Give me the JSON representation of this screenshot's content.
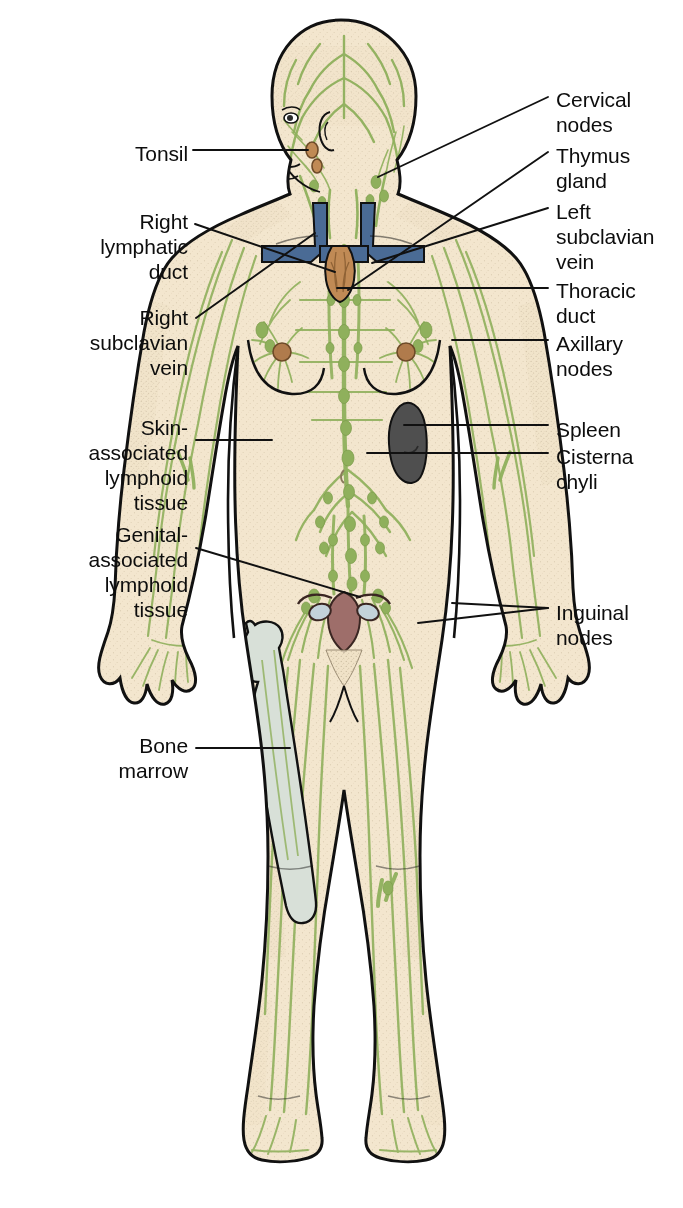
{
  "colors": {
    "skin": "#f3e6ce",
    "skin_shade": "#ece0c4",
    "lymph_green": "#8fb05c",
    "lymph_green_dark": "#7a9b49",
    "outline": "#111111",
    "vein_blue": "#4a6b95",
    "thymus_brown": "#c08a55",
    "spleen_gray": "#4f4f4f",
    "uterus_mauve": "#9e6e6a",
    "ovary_blue": "#c3d2da",
    "bone_gray": "#d6ded6",
    "background": "#ffffff",
    "leader_line": "#111111",
    "text": "#0d0d0d"
  },
  "labels_left": [
    {
      "id": "tonsil",
      "text": "Tonsil",
      "x": 78,
      "y": 141,
      "w": 110,
      "lines": 1
    },
    {
      "id": "right-lymphatic-duct",
      "text": "Right\nlymphatic\nduct",
      "x": 55,
      "y": 209,
      "w": 133,
      "lines": 3
    },
    {
      "id": "right-subclavian-vein",
      "text": "Right\nsubclavian\nvein",
      "x": 48,
      "y": 305,
      "w": 140,
      "lines": 3
    },
    {
      "id": "skin-associated-lymphoid-tissue",
      "text": "Skin-\nassociated\nlymphoid\ntissue",
      "x": 40,
      "y": 415,
      "w": 148,
      "lines": 4
    },
    {
      "id": "genital-associated-lymphoid-tissue",
      "text": "Genital-\nassociated\nlymphoid\ntissue",
      "x": 40,
      "y": 522,
      "w": 148,
      "lines": 4
    },
    {
      "id": "bone-marrow",
      "text": "Bone\nmarrow",
      "x": 80,
      "y": 733,
      "w": 108,
      "lines": 2
    }
  ],
  "labels_right": [
    {
      "id": "cervical-nodes",
      "text": "Cervical\nnodes",
      "x": 556,
      "y": 87,
      "lines": 2
    },
    {
      "id": "thymus-gland",
      "text": "Thymus\ngland",
      "x": 556,
      "y": 143,
      "lines": 2
    },
    {
      "id": "left-subclavian-vein",
      "text": "Left\nsubclavian\nvein",
      "x": 556,
      "y": 199,
      "lines": 3
    },
    {
      "id": "thoracic-duct",
      "text": "Thoracic\nduct",
      "x": 556,
      "y": 278,
      "lines": 2
    },
    {
      "id": "axillary-nodes",
      "text": "Axillary\nnodes",
      "x": 556,
      "y": 331,
      "lines": 2
    },
    {
      "id": "spleen",
      "text": "Spleen",
      "x": 556,
      "y": 417,
      "lines": 1
    },
    {
      "id": "cisterna-chyli",
      "text": "Cisterna\nchyli",
      "x": 556,
      "y": 444,
      "lines": 2
    },
    {
      "id": "inguinal-nodes",
      "text": "Inguinal\nnodes",
      "x": 556,
      "y": 600,
      "lines": 2
    }
  ],
  "leader_lines": [
    {
      "id": "tonsil-leader",
      "points": "193,150 308,150"
    },
    {
      "id": "right-lymphatic-duct-leader",
      "points": "195,224 335,272"
    },
    {
      "id": "right-subclavian-vein-leader",
      "points": "196,318 315,233"
    },
    {
      "id": "skin-associated-leader",
      "points": "196,440 272,440"
    },
    {
      "id": "genital-associated-leader",
      "points": "196,548 360,597"
    },
    {
      "id": "bone-marrow-leader",
      "points": "196,748 290,748"
    },
    {
      "id": "cervical-nodes-leader",
      "points": "548,97 378,177"
    },
    {
      "id": "thymus-gland-leader",
      "points": "548,152 348,290"
    },
    {
      "id": "left-subclavian-vein-leader",
      "points": "548,208 372,263"
    },
    {
      "id": "thoracic-duct-leader",
      "points": "548,288 337,288"
    },
    {
      "id": "axillary-nodes-leader",
      "points": "548,340 452,340"
    },
    {
      "id": "spleen-leader",
      "points": "548,425 404,425"
    },
    {
      "id": "cisterna-chyli-leader",
      "points": "548,453 367,453"
    },
    {
      "id": "inguinal-nodes-leader-a",
      "points": "548,608 452,603"
    },
    {
      "id": "inguinal-nodes-leader-b",
      "points": "548,608 418,623"
    }
  ],
  "organs": [
    {
      "id": "tonsil",
      "name": "tonsil"
    },
    {
      "id": "cervical-nodes",
      "name": "cervical-nodes"
    },
    {
      "id": "thymus-gland",
      "name": "thymus-gland"
    },
    {
      "id": "left-subclavian-vein",
      "name": "left-subclavian-vein"
    },
    {
      "id": "right-subclavian-vein",
      "name": "right-subclavian-vein"
    },
    {
      "id": "right-lymphatic-duct",
      "name": "right-lymphatic-duct"
    },
    {
      "id": "thoracic-duct",
      "name": "thoracic-duct"
    },
    {
      "id": "axillary-nodes",
      "name": "axillary-nodes"
    },
    {
      "id": "spleen",
      "name": "spleen"
    },
    {
      "id": "cisterna-chyli",
      "name": "cisterna-chyli"
    },
    {
      "id": "inguinal-nodes",
      "name": "inguinal-nodes"
    },
    {
      "id": "bone-marrow",
      "name": "bone-marrow-femur"
    },
    {
      "id": "genital-lymphoid",
      "name": "genital-associated-lymphoid-tissue"
    },
    {
      "id": "skin-lymphoid",
      "name": "skin-associated-lymphoid-tissue"
    }
  ]
}
